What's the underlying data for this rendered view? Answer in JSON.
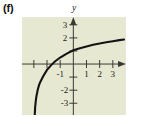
{
  "figure": {
    "part_label": "(f)",
    "panel_background": "#e7e8d2",
    "curve_color": "#141414",
    "axis_color": "#3a3a35"
  },
  "chart_data": {
    "type": "line",
    "title": "",
    "xlabel": "x",
    "ylabel": "y",
    "xlim": [
      -3.9,
      4.0
    ],
    "ylim": [
      -3.9,
      3.6
    ],
    "grid": false,
    "legend": null,
    "x_ticks": [
      -1,
      1,
      2,
      3
    ],
    "x_tick_labels": [
      "-1",
      "1",
      "2",
      "3"
    ],
    "y_ticks": [
      -3,
      -2,
      2,
      3
    ],
    "y_tick_labels": [
      "-3",
      "-2",
      "2",
      "3"
    ],
    "x_axis_arrow_label": "x",
    "y_axis_arrow_label": "y",
    "series": [
      {
        "name": "logarithmic curve",
        "description": "increasing concave-down curve with vertical asymptote near x = -3",
        "vertical_asymptote": -3,
        "x_intercept": -2,
        "x": [
          -2.93,
          -2.9,
          -2.85,
          -2.8,
          -2.7,
          -2.6,
          -2.5,
          -2.3,
          -2.0,
          -1.7,
          -1.4,
          -1.0,
          -0.5,
          0.0,
          0.5,
          1.0,
          1.5,
          2.0,
          2.5,
          3.0,
          3.5,
          3.85
        ],
        "y": [
          -3.85,
          -3.3,
          -2.8,
          -2.45,
          -1.95,
          -1.6,
          -1.35,
          -0.95,
          -0.45,
          -0.1,
          0.2,
          0.5,
          0.8,
          1.05,
          1.2,
          1.35,
          1.47,
          1.57,
          1.67,
          1.75,
          1.83,
          1.88
        ]
      }
    ]
  }
}
